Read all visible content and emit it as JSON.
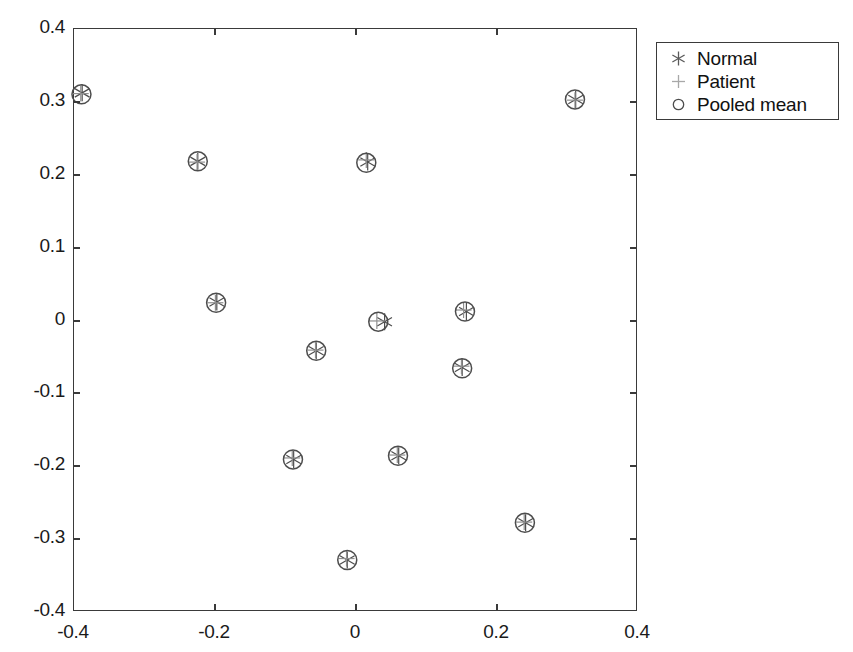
{
  "chart_data": {
    "type": "scatter",
    "title": "",
    "xlabel": "",
    "ylabel": "",
    "xlim": [
      -0.4,
      0.4
    ],
    "ylim": [
      -0.4,
      0.4
    ],
    "xticks": [
      "-0.4",
      "-0.2",
      "0",
      "0.2",
      "0.4"
    ],
    "xtick_values": [
      -0.4,
      -0.2,
      0,
      0.2,
      0.4
    ],
    "yticks": [
      "0.4",
      "0.3",
      "0.2",
      "0.1",
      "0",
      "-0.1",
      "-0.2",
      "-0.3",
      "-0.4"
    ],
    "ytick_values": [
      0.4,
      0.3,
      0.2,
      0.1,
      0,
      -0.1,
      -0.2,
      -0.3,
      -0.4
    ],
    "grid": false,
    "legend_position": "outside-top-right",
    "legend": [
      {
        "label": "Normal",
        "marker": "asterisk"
      },
      {
        "label": "Patient",
        "marker": "plus"
      },
      {
        "label": "Pooled mean",
        "marker": "circle"
      }
    ],
    "series": [
      {
        "name": "Normal",
        "marker": "asterisk",
        "points": [
          {
            "x": -0.387,
            "y": 0.311
          },
          {
            "x": -0.223,
            "y": 0.217
          },
          {
            "x": 0.018,
            "y": 0.216
          },
          {
            "x": 0.313,
            "y": 0.302
          },
          {
            "x": -0.196,
            "y": 0.024
          },
          {
            "x": 0.042,
            "y": -0.003
          },
          {
            "x": 0.158,
            "y": 0.011
          },
          {
            "x": -0.055,
            "y": -0.043
          },
          {
            "x": 0.152,
            "y": -0.066
          },
          {
            "x": -0.087,
            "y": -0.192
          },
          {
            "x": 0.062,
            "y": -0.187
          },
          {
            "x": 0.242,
            "y": -0.279
          },
          {
            "x": -0.011,
            "y": -0.33
          }
        ]
      },
      {
        "name": "Patient",
        "marker": "plus",
        "points": [
          {
            "x": -0.389,
            "y": 0.31
          },
          {
            "x": -0.224,
            "y": 0.216
          },
          {
            "x": 0.016,
            "y": 0.219
          },
          {
            "x": 0.312,
            "y": 0.301
          },
          {
            "x": -0.198,
            "y": 0.023
          },
          {
            "x": 0.031,
            "y": -0.002
          },
          {
            "x": 0.154,
            "y": 0.013
          },
          {
            "x": -0.056,
            "y": -0.042
          },
          {
            "x": 0.151,
            "y": -0.064
          },
          {
            "x": -0.089,
            "y": -0.19
          },
          {
            "x": 0.06,
            "y": -0.186
          },
          {
            "x": 0.24,
            "y": -0.278
          },
          {
            "x": -0.012,
            "y": -0.328
          }
        ]
      },
      {
        "name": "Pooled mean",
        "marker": "circle",
        "points": [
          {
            "x": -0.388,
            "y": 0.309
          },
          {
            "x": -0.223,
            "y": 0.217
          },
          {
            "x": 0.016,
            "y": 0.215
          },
          {
            "x": 0.312,
            "y": 0.302
          },
          {
            "x": -0.197,
            "y": 0.023
          },
          {
            "x": 0.033,
            "y": -0.003
          },
          {
            "x": 0.156,
            "y": 0.011
          },
          {
            "x": -0.055,
            "y": -0.043
          },
          {
            "x": 0.152,
            "y": -0.067
          },
          {
            "x": -0.088,
            "y": -0.192
          },
          {
            "x": 0.061,
            "y": -0.187
          },
          {
            "x": 0.241,
            "y": -0.279
          },
          {
            "x": -0.011,
            "y": -0.33
          }
        ]
      }
    ],
    "colors": {
      "marker": "#4d4d4d",
      "axis": "#3a3a3a",
      "text": "#111111",
      "background": "#ffffff"
    }
  },
  "geometry": {
    "plot_left": 73,
    "plot_top": 28,
    "plot_right": 637,
    "plot_bottom": 611,
    "legend_left": 656,
    "legend_top": 42,
    "legend_width": 183,
    "legend_height": 78
  }
}
